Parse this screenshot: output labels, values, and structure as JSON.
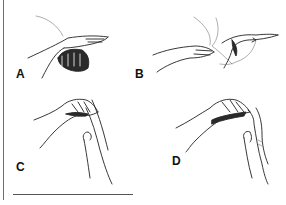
{
  "figure": {
    "panels": [
      {
        "id": "A",
        "label": "A"
      },
      {
        "id": "B",
        "label": "B"
      },
      {
        "id": "C",
        "label": "C"
      },
      {
        "id": "D",
        "label": "D"
      }
    ]
  },
  "colors": {
    "ink": "#222222",
    "background": "#ffffff",
    "rule": "#6e6e6e"
  }
}
